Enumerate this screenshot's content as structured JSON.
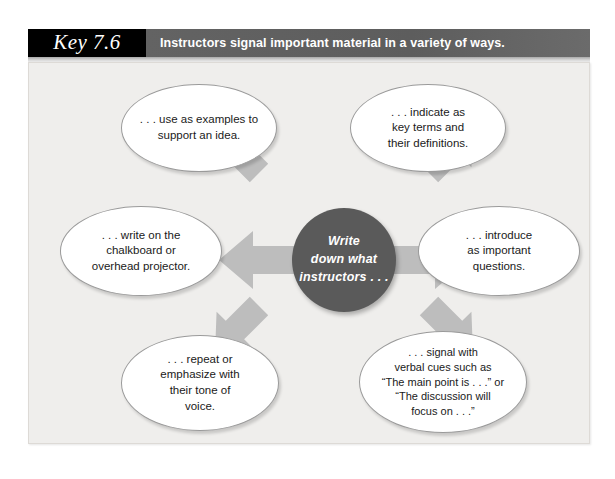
{
  "header": {
    "key_label": "Key 7.6",
    "title": "Instructors signal important material in a variety of ways."
  },
  "diagram": {
    "type": "radial-hub-and-spoke",
    "center": {
      "label": "Write\ndown what\ninstructors . . .",
      "color": "#5a5a5a",
      "text_color": "#ffffff"
    },
    "arrow_color": "#bdbdbd",
    "arrow_count": 6,
    "background_color": "#efeeec",
    "nodes": [
      {
        "id": "top-left",
        "direction": "upper-left",
        "label": ". . . use as examples to\nsupport an idea."
      },
      {
        "id": "top-right",
        "direction": "upper-right",
        "label": ". . . indicate as\nkey terms and\ntheir definitions."
      },
      {
        "id": "left",
        "direction": "left",
        "label": ". . . write on the\nchalkboard or\noverhead projector."
      },
      {
        "id": "right",
        "direction": "right",
        "label": ". . . introduce\nas important\nquestions."
      },
      {
        "id": "bottom-left",
        "direction": "lower-left",
        "label": ". . . repeat or\nemphasize with\ntheir tone of\nvoice."
      },
      {
        "id": "bottom-right",
        "direction": "lower-right",
        "label": ". . . signal with\nverbal cues such as\n“The main point is . . .” or\n“The discussion will\nfocus on . . .”"
      }
    ]
  }
}
